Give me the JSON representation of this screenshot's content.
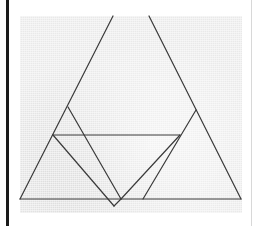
{
  "diagram": {
    "type": "geometric-triangle-figure",
    "stroke_color": "#3a3a3a",
    "background_color": "#e9e9e9",
    "segments": [
      {
        "name": "big-triangle-left-side",
        "x1": 20,
        "y1": 199,
        "x2": 113,
        "y2": 16
      },
      {
        "name": "big-triangle-right-side",
        "x1": 149,
        "y1": 16,
        "x2": 241,
        "y2": 199
      },
      {
        "name": "big-triangle-base",
        "x1": 20,
        "y1": 199,
        "x2": 241,
        "y2": 199
      },
      {
        "name": "horizontal-midline",
        "x1": 53,
        "y1": 135,
        "x2": 180,
        "y2": 135
      },
      {
        "name": "left-diagonal-outer",
        "x1": 53,
        "y1": 135,
        "x2": 114,
        "y2": 206
      },
      {
        "name": "left-diagonal-inner",
        "x1": 68,
        "y1": 107,
        "x2": 121,
        "y2": 199
      },
      {
        "name": "bottom-notch",
        "x1": 114,
        "y1": 206,
        "x2": 121,
        "y2": 199
      },
      {
        "name": "right-diagonal-inner",
        "x1": 121,
        "y1": 199,
        "x2": 180,
        "y2": 135
      },
      {
        "name": "right-diagonal-outer",
        "x1": 196,
        "y1": 110,
        "x2": 143,
        "y2": 199
      }
    ]
  }
}
